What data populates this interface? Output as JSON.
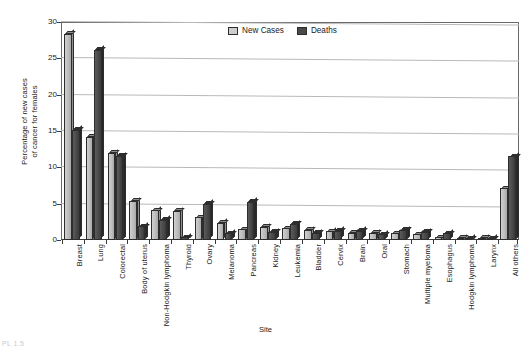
{
  "chart_data": {
    "type": "bar",
    "title": "",
    "xlabel": "Site",
    "ylabel": "Percentage of new cases of cancer for females",
    "ylabel_line1": "Percentage of new cases",
    "ylabel_line2": "of cancer for females",
    "ylim": [
      0,
      30
    ],
    "yticks": [
      0,
      5,
      10,
      15,
      20,
      25,
      30
    ],
    "grid": true,
    "legend_position": "top-center",
    "categories": [
      "Breast",
      "Lung",
      "Colorectal",
      "Body of uterus",
      "Non-Hodgkin lymphoma",
      "Thyroid",
      "Ovary",
      "Melanoma",
      "Pancreas",
      "Kidney",
      "Leukemia",
      "Bladder",
      "Cervix",
      "Brain",
      "Oral",
      "Stomach",
      "Multiple myeloma",
      "Esophagus",
      "Hodgkin lymphoma",
      "Larynx",
      "All others"
    ],
    "series": [
      {
        "name": "New Cases",
        "color": "#c4c4c4",
        "values": [
          28.4,
          14.2,
          12.0,
          5.4,
          4.1,
          4.0,
          3.1,
          2.4,
          1.5,
          1.8,
          1.6,
          1.4,
          1.2,
          1.0,
          1.0,
          0.9,
          0.8,
          0.4,
          0.3,
          0.3,
          7.1
        ]
      },
      {
        "name": "Deaths",
        "color": "#454545",
        "values": [
          15.2,
          26.2,
          11.6,
          1.9,
          2.8,
          0.4,
          5.0,
          0.9,
          5.3,
          1.1,
          2.2,
          1.0,
          1.3,
          1.3,
          0.8,
          1.4,
          1.1,
          0.9,
          0.2,
          0.2,
          11.5
        ]
      }
    ]
  },
  "legend": {
    "items": [
      {
        "label": "New Cases",
        "swatch": "light-gray"
      },
      {
        "label": "Deaths",
        "swatch": "dark-gray"
      }
    ]
  },
  "axes": {
    "y_title_line1": "Percentage of new cases",
    "y_title_line2": "of cancer for females",
    "x_title": "Site",
    "y_tick_labels": [
      "0",
      "5",
      "10",
      "15",
      "20",
      "25",
      "30"
    ]
  },
  "footer": {
    "fragment": "PL 1.5"
  }
}
